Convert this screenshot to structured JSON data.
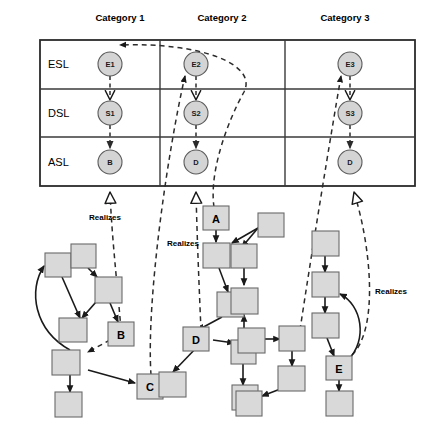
{
  "diagram": {
    "colors": {
      "circle_fill": "#d4d4d4",
      "circle_stroke": "#5b5b5b",
      "box_fill": "#d9d9d9",
      "box_stroke": "#6a6a6a",
      "line": "#1a1a1a",
      "grid": "#2b2b2b",
      "background": "#ffffff"
    },
    "matrix": {
      "columns": [
        {
          "id": "cat1",
          "label": "Category 1"
        },
        {
          "id": "cat2",
          "label": "Category 2"
        },
        {
          "id": "cat3",
          "label": "Category 3"
        }
      ],
      "rows": [
        {
          "id": "esl",
          "label": "ESL"
        },
        {
          "id": "dsl",
          "label": "DSL"
        },
        {
          "id": "asl",
          "label": "ASL"
        }
      ],
      "cells": [
        {
          "row": "esl",
          "column": "cat1",
          "node": "E1"
        },
        {
          "row": "esl",
          "column": "cat2",
          "node": "E2"
        },
        {
          "row": "esl",
          "column": "cat3",
          "node": "E3"
        },
        {
          "row": "dsl",
          "column": "cat1",
          "node": "S1"
        },
        {
          "row": "dsl",
          "column": "cat2",
          "node": "S2"
        },
        {
          "row": "dsl",
          "column": "cat3",
          "node": "S3"
        },
        {
          "row": "asl",
          "column": "cat1",
          "node": "B"
        },
        {
          "row": "asl",
          "column": "cat2",
          "node": "D"
        },
        {
          "row": "asl",
          "column": "cat3",
          "node": "D"
        }
      ]
    },
    "graph": {
      "labeled_nodes": [
        {
          "id": "A",
          "label": "A",
          "cluster": "middle"
        },
        {
          "id": "B",
          "label": "B",
          "cluster": "left"
        },
        {
          "id": "C",
          "label": "C",
          "cluster": "left"
        },
        {
          "id": "D",
          "label": "D",
          "cluster": "middle"
        },
        {
          "id": "E",
          "label": "E",
          "cluster": "right"
        }
      ],
      "unlabeled_node_count": 22
    },
    "realizes_links": [
      {
        "label": "Realizes",
        "from": "B",
        "to": "B (ASL / Category 1)"
      },
      {
        "label": "Realizes",
        "from": "D",
        "to": "D (ASL / Category 2)"
      },
      {
        "label": "Realizes",
        "from": "E",
        "to": "D (ASL / Category 3)"
      }
    ],
    "trace_links": [
      {
        "from": "C",
        "to": "E2 (ESL / Category 2)"
      },
      {
        "from": "A",
        "to": "E1 (ESL / Category 1)"
      },
      {
        "from": "right cluster",
        "to": "E3 (ESL / Category 3)"
      }
    ],
    "labels": {
      "realizes": "Realizes"
    }
  }
}
